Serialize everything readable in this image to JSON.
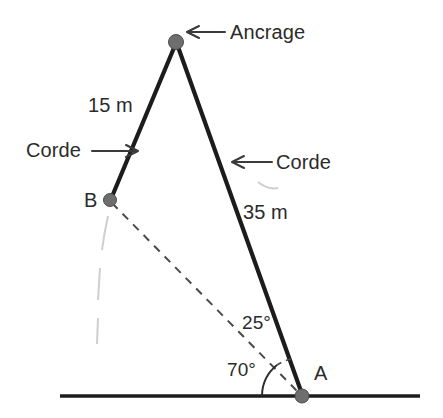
{
  "figure": {
    "title": "Ancrage",
    "background_color": "#ffffff",
    "line_color": "#1c1c1c",
    "dot_color": "#6e6e6e",
    "dash_color": "#4a4a4a"
  },
  "labels": {
    "anchor": "Ancrage",
    "rope_left_length": "15 m",
    "rope_left_name": "Corde",
    "rope_right_name": "Corde",
    "rope_right_length": "35 m",
    "point_b": "B",
    "point_a": "A",
    "angle_inner": "25°",
    "angle_ground": "70°"
  },
  "geometry": {
    "points": {
      "anchor": {
        "x": 176,
        "y": 42
      },
      "b": {
        "x": 110,
        "y": 200
      },
      "a": {
        "x": 302,
        "y": 396
      }
    },
    "ground": {
      "x1": 60,
      "y1": 396,
      "x2": 420,
      "y2": 396
    },
    "segments": [
      {
        "name": "anchor-to-b",
        "length": "15 m",
        "style": "solid"
      },
      {
        "name": "anchor-to-a",
        "length": "35 m",
        "style": "solid"
      },
      {
        "name": "b-to-a",
        "length": "",
        "style": "dashed"
      }
    ],
    "angles": [
      {
        "name": "angle-at-a-between-ba-and-anchor-a",
        "value": "25°"
      },
      {
        "name": "angle-at-a-between-ground-and-ba",
        "value": "70°"
      }
    ]
  }
}
